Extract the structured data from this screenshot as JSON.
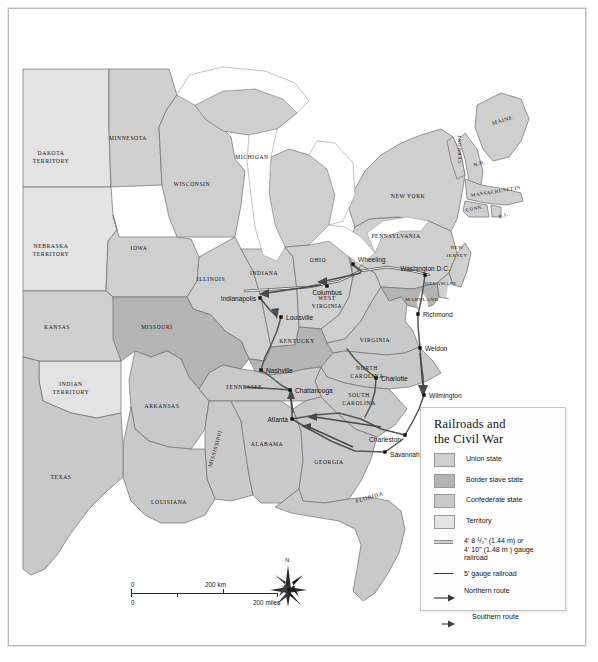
{
  "map": {
    "title": "Railroads and the Civil War",
    "states": [
      {
        "name": "DAKOTA TERRITORY",
        "class": "territory",
        "lines": [
          "DAKOTA",
          "TERRITORY"
        ],
        "x": 42,
        "y": 146,
        "size": "sm"
      },
      {
        "name": "MINNESOTA",
        "class": "union",
        "lines": [
          "MINNESOTA"
        ],
        "x": 119,
        "y": 131,
        "size": "sm"
      },
      {
        "name": "WISCONSIN",
        "class": "union",
        "lines": [
          "WISCONSIN"
        ],
        "x": 183,
        "y": 177,
        "size": "sm"
      },
      {
        "name": "MICHIGAN",
        "class": "union",
        "lines": [
          "MICHIGAN"
        ],
        "x": 243,
        "y": 150,
        "size": "sm"
      },
      {
        "name": "IOWA",
        "class": "union",
        "lines": [
          "IOWA"
        ],
        "x": 130,
        "y": 241,
        "size": "sm"
      },
      {
        "name": "NEBRASKA TERRITORY",
        "class": "territory",
        "lines": [
          "NEBRASKA",
          "TERRITORY"
        ],
        "x": 42,
        "y": 239,
        "size": "sm"
      },
      {
        "name": "KANSAS",
        "class": "union",
        "lines": [
          "KANSAS"
        ],
        "x": 48,
        "y": 320,
        "size": "sm"
      },
      {
        "name": "INDIAN TERRITORY",
        "class": "territory",
        "lines": [
          "INDIAN",
          "TERRITORY"
        ],
        "x": 62,
        "y": 377,
        "size": "sm"
      },
      {
        "name": "MISSOURI",
        "class": "border",
        "lines": [
          "MISSOURI"
        ],
        "x": 148,
        "y": 320,
        "size": "sm"
      },
      {
        "name": "ILLINOIS",
        "class": "union",
        "lines": [
          "ILLINOIS"
        ],
        "x": 202,
        "y": 272,
        "size": "sm"
      },
      {
        "name": "INDIANA",
        "class": "union",
        "lines": [
          "INDIANA"
        ],
        "x": 255,
        "y": 266,
        "size": "sm"
      },
      {
        "name": "OHIO",
        "class": "union",
        "lines": [
          "OHIO"
        ],
        "x": 309,
        "y": 253,
        "size": "sm"
      },
      {
        "name": "KENTUCKY",
        "class": "border",
        "lines": [
          "KENTUCKY"
        ],
        "x": 288,
        "y": 334,
        "size": "sm"
      },
      {
        "name": "TENNESSEE",
        "class": "confederate",
        "lines": [
          "TENNESSEE"
        ],
        "x": 235,
        "y": 380,
        "size": "sm"
      },
      {
        "name": "ARKANSAS",
        "class": "confederate",
        "lines": [
          "ARKANSAS"
        ],
        "x": 153,
        "y": 399,
        "size": "sm"
      },
      {
        "name": "MISSISSIPPI",
        "class": "confederate",
        "lines": [
          "MISSISSIPPI"
        ],
        "x": 208,
        "y": 440,
        "size": "sm",
        "rotate": -74
      },
      {
        "name": "ALABAMA",
        "class": "confederate",
        "lines": [
          "ALABAMA"
        ],
        "x": 258,
        "y": 437,
        "size": "sm"
      },
      {
        "name": "LOUISIANA",
        "class": "confederate",
        "lines": [
          "LOUISIANA"
        ],
        "x": 160,
        "y": 495,
        "size": "sm"
      },
      {
        "name": "TEXAS",
        "class": "confederate",
        "lines": [
          "TEXAS"
        ],
        "x": 52,
        "y": 470,
        "size": "sm"
      },
      {
        "name": "GEORGIA",
        "class": "confederate",
        "lines": [
          "GEORGIA"
        ],
        "x": 320,
        "y": 455,
        "size": "sm"
      },
      {
        "name": "FLORIDA",
        "class": "confederate",
        "lines": [
          "FLORIDA"
        ],
        "x": 361,
        "y": 490,
        "size": "sm",
        "rotate": -16
      },
      {
        "name": "SOUTH CAROLINA",
        "class": "confederate",
        "lines": [
          "SOUTH",
          "CAROLINA"
        ],
        "x": 350,
        "y": 388,
        "size": "sm"
      },
      {
        "name": "NORTH CAROLINA",
        "class": "confederate",
        "lines": [
          "NORTH",
          "CAROLINA"
        ],
        "x": 358,
        "y": 361,
        "size": "sm"
      },
      {
        "name": "VIRGINIA",
        "class": "confederate",
        "lines": [
          "VIRGINIA"
        ],
        "x": 366,
        "y": 333,
        "size": "sm"
      },
      {
        "name": "WEST VIRGINIA",
        "class": "union",
        "lines": [
          "WEST",
          "VIRGINIA"
        ],
        "x": 318,
        "y": 291,
        "size": "sm"
      },
      {
        "name": "MARYLAND",
        "class": "border",
        "lines": [
          "MARYLAND"
        ],
        "x": 413,
        "y": 292,
        "size": "xs"
      },
      {
        "name": "DELAWARE",
        "class": "union",
        "lines": [
          "DELAWARE"
        ],
        "x": 432,
        "y": 276,
        "size": "xs"
      },
      {
        "name": "PENNSYLVANIA",
        "class": "union",
        "lines": [
          "PENNSYLVANIA"
        ],
        "x": 387,
        "y": 229,
        "size": "sm"
      },
      {
        "name": "NEW JERSEY",
        "class": "union",
        "lines": [
          "NEW",
          "JERSEY"
        ],
        "x": 448,
        "y": 240,
        "size": "xs"
      },
      {
        "name": "NEW YORK",
        "class": "union",
        "lines": [
          "NEW YORK"
        ],
        "x": 399,
        "y": 189,
        "size": "sm"
      },
      {
        "name": "VERMONT",
        "class": "union",
        "lines": [
          "VERMONT"
        ],
        "x": 452,
        "y": 140,
        "size": "xs",
        "rotate": -90
      },
      {
        "name": "NEW HAMPSHIRE",
        "class": "union",
        "lines": [
          "N.H."
        ],
        "x": 471,
        "y": 156,
        "size": "xs",
        "rotate": -18
      },
      {
        "name": "MAINE",
        "class": "union",
        "lines": [
          "MAINE"
        ],
        "x": 494,
        "y": 113,
        "size": "sm",
        "rotate": -18
      },
      {
        "name": "MASSACHUSETTS",
        "class": "union",
        "lines": [
          "MASSACHUSETTS"
        ],
        "x": 487,
        "y": 184,
        "size": "xs",
        "rotate": -9
      },
      {
        "name": "CONNECTICUT",
        "class": "union",
        "lines": [
          "CONN."
        ],
        "x": 466,
        "y": 201,
        "size": "xs",
        "rotate": -9
      },
      {
        "name": "RHODE ISLAND",
        "class": "union",
        "lines": [
          "R.I."
        ],
        "x": 495,
        "y": 208,
        "size": "xs",
        "rotate": -18
      }
    ],
    "cities": [
      {
        "name": "Wheeling",
        "x": 344,
        "y": 255,
        "anchor": "start",
        "dx": 5,
        "dy": -2
      },
      {
        "name": "Columbus",
        "x": 318,
        "y": 277,
        "anchor": "middle",
        "dx": 0,
        "dy": 9
      },
      {
        "name": "Indianapolis",
        "x": 251,
        "y": 289,
        "anchor": "end",
        "dx": -4,
        "dy": 3
      },
      {
        "name": "Louisville",
        "x": 272,
        "y": 308,
        "anchor": "start",
        "dx": 5,
        "dy": 3
      },
      {
        "name": "Washington D.C.",
        "x": 416,
        "y": 266,
        "anchor": "middle",
        "dx": 0,
        "dy": -4
      },
      {
        "name": "Richmond",
        "x": 409,
        "y": 305,
        "anchor": "start",
        "dx": 5,
        "dy": 3
      },
      {
        "name": "Weldon",
        "x": 411,
        "y": 339,
        "anchor": "start",
        "dx": 5,
        "dy": 3
      },
      {
        "name": "Wilmington",
        "x": 415,
        "y": 386,
        "anchor": "start",
        "dx": 5,
        "dy": 3
      },
      {
        "name": "Charlotte",
        "x": 367,
        "y": 369,
        "anchor": "start",
        "dx": 5,
        "dy": 3
      },
      {
        "name": "Charleston",
        "x": 396,
        "y": 426,
        "anchor": "end",
        "dx": -4,
        "dy": 7
      },
      {
        "name": "Savannah",
        "x": 376,
        "y": 443,
        "anchor": "start",
        "dx": 5,
        "dy": 5
      },
      {
        "name": "Atlanta",
        "x": 283,
        "y": 410,
        "anchor": "end",
        "dx": -4,
        "dy": 3
      },
      {
        "name": "Chattanooga",
        "x": 281,
        "y": 381,
        "anchor": "start",
        "dx": 5,
        "dy": 3
      },
      {
        "name": "Nashville",
        "x": 252,
        "y": 361,
        "anchor": "start",
        "dx": 5,
        "dy": 3
      }
    ]
  },
  "legend": {
    "title_lines": [
      "Railroads and",
      "the Civil War"
    ],
    "swatches": [
      {
        "label": "Union state",
        "color": "#cfcfcf"
      },
      {
        "label": "Border slave state",
        "color": "#b4b4b4"
      },
      {
        "label": "Confederate state",
        "color": "#c9c9c9"
      },
      {
        "label": "Territory",
        "color": "#e3e3e3"
      }
    ],
    "lines": [
      {
        "label_lines": [
          "4' 8 ¹/₂\" (1.44 m) or",
          "4' 10\" (1.48 m ) gauge",
          "railroad"
        ],
        "style": "gauge"
      },
      {
        "label_lines": [
          "5' gauge railroad"
        ],
        "style": "solid"
      }
    ],
    "routes": [
      {
        "label": "Northern route",
        "style": "full-arrow"
      },
      {
        "label": "Southern route",
        "style": "half-arrow"
      }
    ]
  },
  "scale": {
    "km_zero": "0",
    "km_value": "200 km",
    "miles_zero": "0",
    "miles_value": "200 miles"
  },
  "compass": {
    "north_label": "N"
  },
  "colors": {
    "union": "#cfcfcf",
    "border_slave": "#b4b4b4",
    "confederate": "#c9c9c9",
    "territory": "#e3e3e3",
    "water": "#ffffff",
    "outline": "#6e6e6e",
    "rail_dark": "#5a5a5a"
  }
}
